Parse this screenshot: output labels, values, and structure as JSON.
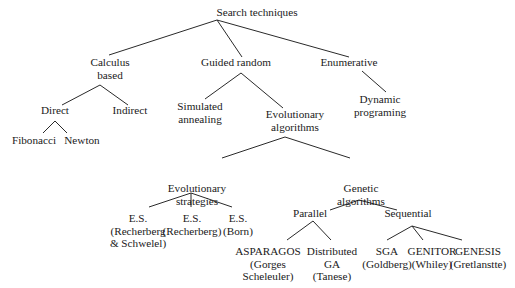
{
  "diagram": {
    "title": "Search techniques",
    "nodes": [
      {
        "id": "root",
        "lines": [
          "Search techniques"
        ],
        "x": 257,
        "y": 16
      },
      {
        "id": "calculus",
        "lines": [
          "Calculus",
          "based"
        ],
        "x": 110,
        "y": 66
      },
      {
        "id": "guided",
        "lines": [
          "Guided random"
        ],
        "x": 236,
        "y": 66
      },
      {
        "id": "enumerative",
        "lines": [
          "Enumerative"
        ],
        "x": 349,
        "y": 66
      },
      {
        "id": "direct",
        "lines": [
          "Direct"
        ],
        "x": 55,
        "y": 114
      },
      {
        "id": "indirect",
        "lines": [
          "Indirect"
        ],
        "x": 130,
        "y": 114
      },
      {
        "id": "simulated",
        "lines": [
          "Simulated",
          "annealing"
        ],
        "x": 200,
        "y": 110
      },
      {
        "id": "evo_alg",
        "lines": [
          "Evolutionary",
          "algorithms"
        ],
        "x": 295,
        "y": 118
      },
      {
        "id": "dynamic",
        "lines": [
          "Dynamic",
          "programing"
        ],
        "x": 380,
        "y": 103
      },
      {
        "id": "fibonacci",
        "lines": [
          "Fibonacci"
        ],
        "x": 34,
        "y": 144
      },
      {
        "id": "newton",
        "lines": [
          "Newton"
        ],
        "x": 82,
        "y": 144
      },
      {
        "id": "evo_strat",
        "lines": [
          "Evolutionary",
          "strategies"
        ],
        "x": 197,
        "y": 192
      },
      {
        "id": "genetic",
        "lines": [
          "Genetic",
          "algorithms"
        ],
        "x": 361,
        "y": 192
      },
      {
        "id": "es1",
        "lines": [
          "E.S.",
          "(Recherberg",
          "& Schwelel)"
        ],
        "x": 138,
        "y": 222
      },
      {
        "id": "es2",
        "lines": [
          "E.S.",
          "(Recherberg)"
        ],
        "x": 192,
        "y": 222
      },
      {
        "id": "es3",
        "lines": [
          "E.S.",
          "(Born)"
        ],
        "x": 238,
        "y": 222
      },
      {
        "id": "parallel",
        "lines": [
          "Parallel"
        ],
        "x": 310,
        "y": 217
      },
      {
        "id": "sequential",
        "lines": [
          "Sequential"
        ],
        "x": 408,
        "y": 217
      },
      {
        "id": "asparagos",
        "lines": [
          "ASPARAGOS",
          "(Gorges",
          "Scheleuler)"
        ],
        "x": 268,
        "y": 255
      },
      {
        "id": "distributed",
        "lines": [
          "Distributed",
          "GA",
          "(Tanese)"
        ],
        "x": 332,
        "y": 255
      },
      {
        "id": "sga",
        "lines": [
          "SGA",
          "(Goldberg)"
        ],
        "x": 387,
        "y": 255
      },
      {
        "id": "genitor",
        "lines": [
          "GENITOR",
          "(Whiley)"
        ],
        "x": 432,
        "y": 255
      },
      {
        "id": "genesis",
        "lines": [
          "GENESIS",
          "(Gretlanstte)"
        ],
        "x": 478,
        "y": 255
      }
    ],
    "edges": [
      {
        "from": "root",
        "to": "calculus",
        "x1": 217,
        "y1": 20,
        "x2": 109,
        "y2": 55
      },
      {
        "from": "root",
        "to": "guided",
        "x1": 217,
        "y1": 20,
        "x2": 242,
        "y2": 57
      },
      {
        "from": "root",
        "to": "enumerative",
        "x1": 217,
        "y1": 20,
        "x2": 349,
        "y2": 57
      },
      {
        "from": "calculus",
        "to": "direct",
        "x1": 100,
        "y1": 85,
        "x2": 62,
        "y2": 105
      },
      {
        "from": "calculus",
        "to": "indirect",
        "x1": 100,
        "y1": 85,
        "x2": 128,
        "y2": 105
      },
      {
        "from": "guided",
        "to": "simulated",
        "x1": 241,
        "y1": 73,
        "x2": 205,
        "y2": 99
      },
      {
        "from": "guided",
        "to": "evo_alg",
        "x1": 241,
        "y1": 73,
        "x2": 283,
        "y2": 108
      },
      {
        "from": "enumerative",
        "to": "dynamic",
        "x1": 362,
        "y1": 71,
        "x2": 386,
        "y2": 92
      },
      {
        "from": "direct",
        "to": "fibonacci",
        "x1": 55,
        "y1": 121,
        "x2": 43,
        "y2": 133
      },
      {
        "from": "direct",
        "to": "newton",
        "x1": 55,
        "y1": 121,
        "x2": 67,
        "y2": 133
      },
      {
        "from": "evo_alg",
        "to": "evo_strat",
        "x1": 285,
        "y1": 137,
        "x2": 222,
        "y2": 158
      },
      {
        "from": "evo_alg",
        "to": "genetic",
        "x1": 285,
        "y1": 137,
        "x2": 350,
        "y2": 158
      },
      {
        "from": "evo_strat",
        "to": "es1",
        "x1": 191,
        "y1": 193,
        "x2": 149,
        "y2": 207
      },
      {
        "from": "evo_strat",
        "to": "es2",
        "x1": 191,
        "y1": 193,
        "x2": 191,
        "y2": 207
      },
      {
        "from": "evo_strat",
        "to": "es3",
        "x1": 191,
        "y1": 193,
        "x2": 232,
        "y2": 207
      },
      {
        "from": "genetic",
        "to": "parallel",
        "x1": 359,
        "y1": 200,
        "x2": 330,
        "y2": 210
      },
      {
        "from": "genetic",
        "to": "sequential",
        "x1": 359,
        "y1": 200,
        "x2": 397,
        "y2": 210
      },
      {
        "from": "parallel",
        "to": "asparagos",
        "x1": 313,
        "y1": 221,
        "x2": 287,
        "y2": 240
      },
      {
        "from": "parallel",
        "to": "distributed",
        "x1": 313,
        "y1": 221,
        "x2": 331,
        "y2": 240
      },
      {
        "from": "sequential",
        "to": "sga",
        "x1": 412,
        "y1": 226,
        "x2": 387,
        "y2": 240
      },
      {
        "from": "sequential",
        "to": "genitor",
        "x1": 412,
        "y1": 226,
        "x2": 423,
        "y2": 240
      },
      {
        "from": "sequential",
        "to": "genesis",
        "x1": 412,
        "y1": 226,
        "x2": 462,
        "y2": 240
      }
    ],
    "colors": {
      "background": "#ffffff",
      "line": "#2a2a2a",
      "text": "#1a1a1a"
    }
  }
}
